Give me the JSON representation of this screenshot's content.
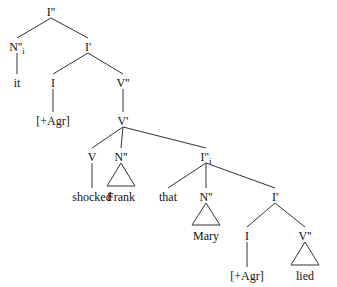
{
  "diagram": {
    "type": "syntax-tree",
    "nodes": [
      {
        "id": "root",
        "label": "I''",
        "x": 51,
        "y": 13
      },
      {
        "id": "subj",
        "label": "N''",
        "sub": "i",
        "x": 17,
        "y": 48
      },
      {
        "id": "it",
        "label": "it",
        "x": 17,
        "y": 84
      },
      {
        "id": "ibar1",
        "label": "I'",
        "x": 88,
        "y": 48
      },
      {
        "id": "infl1",
        "label": "I",
        "x": 53,
        "y": 84
      },
      {
        "id": "agr1",
        "label": "[+Agr]",
        "x": 53,
        "y": 122
      },
      {
        "id": "vp",
        "label": "V''",
        "x": 123,
        "y": 84
      },
      {
        "id": "vbar",
        "label": "V'",
        "x": 123,
        "y": 122
      },
      {
        "id": "verb",
        "label": "V",
        "x": 92,
        "y": 158
      },
      {
        "id": "shocked",
        "label": "shocked",
        "x": 92,
        "y": 198
      },
      {
        "id": "obj",
        "label": "N''",
        "x": 121,
        "y": 158
      },
      {
        "id": "frank",
        "label": "Frank",
        "x": 121,
        "y": 198
      },
      {
        "id": "cp",
        "label": "I''",
        "sub": "i",
        "x": 206,
        "y": 158
      },
      {
        "id": "that",
        "label": "that",
        "x": 168,
        "y": 198
      },
      {
        "id": "subj2",
        "label": "N''",
        "x": 206,
        "y": 198
      },
      {
        "id": "mary",
        "label": "Mary",
        "x": 206,
        "y": 237
      },
      {
        "id": "ibar2",
        "label": "I'",
        "x": 275,
        "y": 198
      },
      {
        "id": "infl2",
        "label": "I",
        "x": 247,
        "y": 237
      },
      {
        "id": "agr2",
        "label": "[+Agr]",
        "x": 247,
        "y": 277
      },
      {
        "id": "vp2",
        "label": "V''",
        "x": 305,
        "y": 237
      },
      {
        "id": "lied",
        "label": "lied",
        "x": 305,
        "y": 277
      }
    ],
    "edges": [
      [
        "root",
        "subj"
      ],
      [
        "root",
        "ibar1"
      ],
      [
        "subj",
        "it"
      ],
      [
        "ibar1",
        "infl1"
      ],
      [
        "ibar1",
        "vp"
      ],
      [
        "infl1",
        "agr1"
      ],
      [
        "vp",
        "vbar"
      ],
      [
        "vbar",
        "verb"
      ],
      [
        "vbar",
        "obj"
      ],
      [
        "vbar",
        "cp"
      ],
      [
        "verb",
        "shocked"
      ],
      [
        "cp",
        "that"
      ],
      [
        "cp",
        "subj2"
      ],
      [
        "cp",
        "ibar2"
      ],
      [
        "ibar2",
        "infl2"
      ],
      [
        "ibar2",
        "vp2"
      ],
      [
        "infl2",
        "agr2"
      ]
    ],
    "triangles": [
      {
        "from": "obj",
        "to": "frank"
      },
      {
        "from": "subj2",
        "to": "mary"
      },
      {
        "from": "vp2",
        "to": "lied"
      }
    ]
  }
}
